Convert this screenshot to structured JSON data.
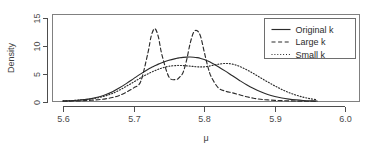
{
  "chart_data": {
    "type": "line",
    "title": "",
    "xlabel": "μ",
    "ylabel": "Density",
    "xlim": [
      5.585,
      6.02
    ],
    "ylim": [
      0,
      15.6
    ],
    "xticks": [
      5.6,
      5.7,
      5.8,
      5.9,
      6.0
    ],
    "xticklabels": [
      "5.6",
      "5.7",
      "5.8",
      "5.9",
      "6.0"
    ],
    "yticks": [
      0,
      5,
      10,
      15
    ],
    "yticklabels": [
      "0",
      "5",
      "10",
      "15"
    ],
    "grid": false,
    "legend_position": "top-right",
    "legend_entries": [
      "Original k",
      "Large k",
      "Small k"
    ],
    "x": [
      5.6,
      5.61,
      5.62,
      5.63,
      5.64,
      5.65,
      5.66,
      5.67,
      5.68,
      5.69,
      5.7,
      5.71,
      5.72,
      5.725,
      5.73,
      5.735,
      5.74,
      5.75,
      5.76,
      5.765,
      5.77,
      5.775,
      5.78,
      5.785,
      5.79,
      5.795,
      5.8,
      5.805,
      5.81,
      5.82,
      5.83,
      5.84,
      5.85,
      5.86,
      5.87,
      5.88,
      5.89,
      5.9,
      5.91,
      5.92,
      5.93,
      5.94,
      5.95,
      5.96
    ],
    "series": [
      {
        "name": "Original k",
        "style": "solid",
        "values": [
          0.1,
          0.14,
          0.22,
          0.34,
          0.52,
          0.8,
          1.2,
          1.75,
          2.45,
          3.25,
          4.1,
          4.95,
          5.75,
          6.1,
          6.4,
          6.7,
          6.95,
          7.4,
          7.72,
          7.84,
          7.92,
          7.96,
          7.97,
          7.94,
          7.86,
          7.72,
          7.52,
          7.26,
          6.95,
          6.25,
          5.45,
          4.6,
          3.78,
          3.0,
          2.32,
          1.74,
          1.26,
          0.9,
          0.62,
          0.42,
          0.28,
          0.18,
          0.12,
          0.08
        ]
      },
      {
        "name": "Large k",
        "style": "dashed",
        "values": [
          0.05,
          0.07,
          0.1,
          0.15,
          0.22,
          0.32,
          0.48,
          0.72,
          1.1,
          1.7,
          2.45,
          3.6,
          8.6,
          11.8,
          13.05,
          11.6,
          8.4,
          4.4,
          3.95,
          4.35,
          5.2,
          7.4,
          10.4,
          12.4,
          12.7,
          11.6,
          8.9,
          6.3,
          4.4,
          2.45,
          1.85,
          1.55,
          1.2,
          0.85,
          0.58,
          0.4,
          0.28,
          0.2,
          0.15,
          0.11,
          0.08,
          0.06,
          0.04,
          0.03
        ]
      },
      {
        "name": "Small k",
        "style": "dotted",
        "values": [
          0.12,
          0.16,
          0.22,
          0.32,
          0.46,
          0.68,
          1.0,
          1.45,
          2.05,
          2.75,
          3.5,
          4.25,
          4.95,
          5.25,
          5.52,
          5.78,
          6.0,
          6.32,
          6.45,
          6.46,
          6.44,
          6.4,
          6.34,
          6.28,
          6.22,
          6.2,
          6.22,
          6.3,
          6.42,
          6.68,
          6.82,
          6.7,
          6.3,
          5.7,
          5.0,
          4.25,
          3.5,
          2.8,
          2.15,
          1.6,
          1.15,
          0.78,
          0.5,
          0.3
        ]
      }
    ]
  },
  "legend": {
    "items": [
      {
        "label": "Original k",
        "style": "solid"
      },
      {
        "label": "Large k",
        "style": "dashed"
      },
      {
        "label": "Small k",
        "style": "dotted"
      }
    ]
  },
  "axes": {
    "y_title": "Density",
    "x_title": "μ"
  }
}
